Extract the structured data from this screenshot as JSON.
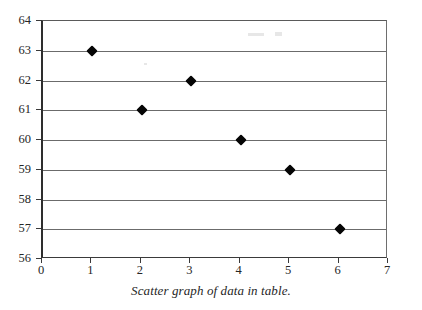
{
  "caption": "Scatter graph of data in table.",
  "chart_data": {
    "type": "scatter",
    "title": "",
    "subtitle": "",
    "xlabel": "",
    "ylabel": "",
    "xlim": [
      0,
      7
    ],
    "ylim": [
      56,
      64
    ],
    "xticks": [
      "0",
      "1",
      "2",
      "3",
      "4",
      "5",
      "6",
      "7"
    ],
    "yticks": [
      "56",
      "57",
      "58",
      "59",
      "60",
      "61",
      "62",
      "63",
      "64"
    ],
    "grid": "horizontal",
    "legend": "none",
    "marker": "black-diamond",
    "points": [
      {
        "x": 1,
        "y": 63
      },
      {
        "x": 2,
        "y": 61
      },
      {
        "x": 3,
        "y": 62
      },
      {
        "x": 4,
        "y": 60
      },
      {
        "x": 5,
        "y": 59
      },
      {
        "x": 6,
        "y": 57
      }
    ],
    "x": [
      1,
      2,
      3,
      4,
      5,
      6
    ],
    "values": [
      63,
      61,
      62,
      60,
      59,
      57
    ],
    "colors": {
      "marker": "#050505",
      "gridline": "#6b6b6b",
      "axis": "#2e2e2e",
      "text": "#262626",
      "background": "#ffffff"
    }
  }
}
